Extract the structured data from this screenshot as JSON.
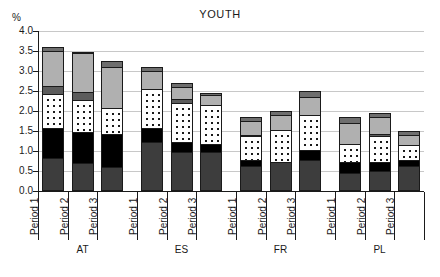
{
  "chart_data": {
    "type": "bar",
    "subtype": "stacked-bar-grouped",
    "title": "YOUTH",
    "xlabel": "",
    "ylabel": "%",
    "ylim": [
      0.0,
      4.0
    ],
    "ytick_step": 0.5,
    "ytick_labels": [
      "0.0",
      "0.5",
      "1.0",
      "1.5",
      "2.0",
      "2.5",
      "3.0",
      "3.5",
      "4.0"
    ],
    "grid": true,
    "legend": "none",
    "groups": [
      "AT",
      "ES",
      "FR",
      "PL"
    ],
    "categories": [
      "Period 1",
      "Period 2",
      "Period 3",
      "Period 1",
      "Period 2",
      "Period 3",
      "Period 1",
      "Period 2",
      "Period 3",
      "Period 1",
      "Period 2",
      "Period 3"
    ],
    "series": [
      {
        "name": "segment-1-dark-gray",
        "color": "#3d3d3d",
        "values": [
          0.78,
          0.65,
          0.56,
          1.2,
          0.95,
          0.95,
          0.6,
          0.7,
          0.75,
          0.4,
          0.45,
          0.6
        ]
      },
      {
        "name": "segment-2-black",
        "color": "#000000",
        "values": [
          0.77,
          0.8,
          0.84,
          0.35,
          0.25,
          0.2,
          0.15,
          0.0,
          0.25,
          0.3,
          0.25,
          0.15
        ]
      },
      {
        "name": "segment-3-white-dotted",
        "color": "#ffffff",
        "values": [
          0.85,
          0.8,
          0.65,
          1.0,
          1.0,
          1.0,
          0.6,
          0.8,
          0.9,
          0.45,
          0.65,
          0.4
        ]
      },
      {
        "name": "segment-4-medium-gray",
        "color": "#5c5c5c",
        "values": [
          0.2,
          0.2,
          0.0,
          0.0,
          0.1,
          0.0,
          0.05,
          0.0,
          0.0,
          0.0,
          0.05,
          0.0
        ]
      },
      {
        "name": "segment-5-light-gray",
        "color": "#b0b0b0",
        "values": [
          0.9,
          1.0,
          1.05,
          0.45,
          0.3,
          0.25,
          0.35,
          0.4,
          0.45,
          0.55,
          0.45,
          0.25
        ]
      },
      {
        "name": "segment-6-top-gray",
        "color": "#6e6e6e",
        "values": [
          0.1,
          0.03,
          0.15,
          0.1,
          0.1,
          0.05,
          0.1,
          0.1,
          0.15,
          0.15,
          0.1,
          0.1
        ]
      }
    ],
    "totals": [
      3.6,
      3.48,
      3.25,
      3.1,
      2.7,
      2.45,
      1.85,
      2.0,
      2.5,
      1.85,
      1.95,
      1.5
    ]
  }
}
